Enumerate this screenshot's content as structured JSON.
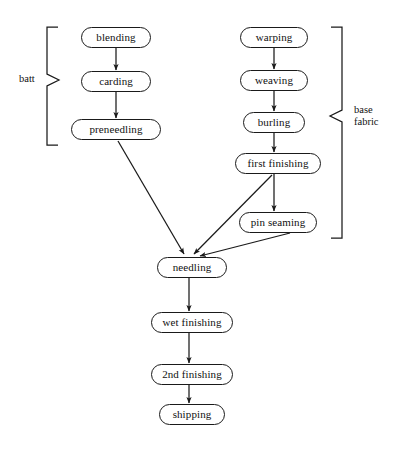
{
  "diagram": {
    "background_color": "#ffffff",
    "line_color": "#1a1a1a",
    "text_color": "#111111",
    "canvas": {
      "width": 402,
      "height": 455
    }
  },
  "nodes": [
    {
      "id": "blending",
      "label": "blending",
      "x": 81,
      "y": 27,
      "w": 70,
      "h": 21
    },
    {
      "id": "carding",
      "label": "carding",
      "x": 81,
      "y": 71,
      "w": 70,
      "h": 21
    },
    {
      "id": "preneedling",
      "label": "preneedling",
      "x": 71,
      "y": 119,
      "w": 90,
      "h": 21
    },
    {
      "id": "warping",
      "label": "warping",
      "x": 240,
      "y": 27,
      "w": 68,
      "h": 21
    },
    {
      "id": "weaving",
      "label": "weaving",
      "x": 240,
      "y": 70,
      "w": 68,
      "h": 21
    },
    {
      "id": "burling",
      "label": "burling",
      "x": 243,
      "y": 112,
      "w": 62,
      "h": 21
    },
    {
      "id": "first_finishing",
      "label": "first finishing",
      "x": 235,
      "y": 153,
      "w": 86,
      "h": 21
    },
    {
      "id": "pin_seaming",
      "label": "pin seaming",
      "x": 239,
      "y": 212,
      "w": 78,
      "h": 21
    },
    {
      "id": "needling",
      "label": "needling",
      "x": 157,
      "y": 257,
      "w": 70,
      "h": 21
    },
    {
      "id": "wet_finishing",
      "label": "wet finishing",
      "x": 151,
      "y": 312,
      "w": 82,
      "h": 21
    },
    {
      "id": "second_finishing",
      "label": "2nd finishing",
      "x": 151,
      "y": 364,
      "w": 82,
      "h": 21
    },
    {
      "id": "shipping",
      "label": "shipping",
      "x": 159,
      "y": 404,
      "w": 66,
      "h": 21
    }
  ],
  "edges": [
    {
      "id": "blending-carding",
      "from": "blending",
      "to": "carding",
      "kind": "straight-vertical"
    },
    {
      "id": "carding-preneedling",
      "from": "carding",
      "to": "preneedling",
      "kind": "straight-vertical"
    },
    {
      "id": "preneedling-needling",
      "from": "preneedling",
      "to": "needling",
      "kind": "diagonal"
    },
    {
      "id": "warping-weaving",
      "from": "warping",
      "to": "weaving",
      "kind": "straight-vertical"
    },
    {
      "id": "weaving-burling",
      "from": "weaving",
      "to": "burling",
      "kind": "straight-vertical"
    },
    {
      "id": "burling-first-finishing",
      "from": "burling",
      "to": "first_finishing",
      "kind": "straight-vertical"
    },
    {
      "id": "first-finishing-pin-seaming",
      "from": "first_finishing",
      "to": "pin_seaming",
      "kind": "straight-vertical"
    },
    {
      "id": "first-finishing-needling",
      "from": "first_finishing",
      "to": "needling",
      "kind": "diagonal"
    },
    {
      "id": "pin-seaming-needling",
      "from": "pin_seaming",
      "to": "needling",
      "kind": "diagonal"
    },
    {
      "id": "needling-wet-finishing",
      "from": "needling",
      "to": "wet_finishing",
      "kind": "straight-vertical"
    },
    {
      "id": "wet-finishing-second-finishing",
      "from": "wet_finishing",
      "to": "second_finishing",
      "kind": "straight-vertical"
    },
    {
      "id": "second-finishing-shipping",
      "from": "second_finishing",
      "to": "shipping",
      "kind": "straight-vertical"
    }
  ],
  "groups": [
    {
      "id": "batt",
      "label": "batt",
      "side": "left",
      "covers": [
        "blending",
        "carding",
        "preneedling"
      ],
      "label_x": 19,
      "label_y": 73,
      "brace": {
        "spine_x": 47,
        "top_y": 27,
        "bottom_y": 145,
        "tip_x": 58,
        "point_x": 59,
        "point_y": 80
      }
    },
    {
      "id": "base_fabric",
      "label": "base\nfabric",
      "side": "right",
      "covers": [
        "warping",
        "weaving",
        "burling",
        "first_finishing",
        "pin_seaming"
      ],
      "label_x": 354,
      "label_y": 104,
      "brace": {
        "spine_x": 342,
        "top_y": 27,
        "bottom_y": 238,
        "tip_x": 331,
        "point_x": 330,
        "point_y": 116
      }
    }
  ]
}
